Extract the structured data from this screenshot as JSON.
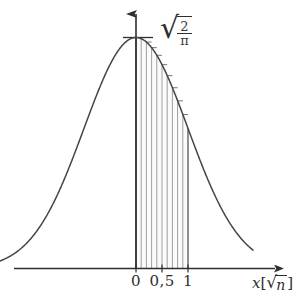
{
  "figure": {
    "name": "half-normal-density-with-histogram",
    "background": "#ffffff",
    "curve_color": "#454545",
    "axis_color": "#3a3a3a",
    "bar_color": "#8a8a8a"
  },
  "labels": {
    "peak_value_radical_sign": "√",
    "peak_value_numerator": "2",
    "peak_value_denominator": "π",
    "x_axis_label_variable": "x",
    "x_axis_label_bracket_open": "[",
    "x_axis_label_sqrt_sign": "√",
    "x_axis_label_sqrt_arg": "n",
    "x_axis_label_bracket_close": "]"
  },
  "x_ticks": [
    {
      "value": 0,
      "label": "0",
      "px": 136.0
    },
    {
      "value": 0.5,
      "label": "0,5",
      "px": 162.0
    },
    {
      "value": 1,
      "label": "1",
      "px": 188.0
    }
  ],
  "chart_data": {
    "type": "line",
    "title": "",
    "xlabel": "x[√n]",
    "ylabel": "",
    "grid": false,
    "legend": null,
    "xlim": [
      -2.65,
      2.25
    ],
    "ylim": [
      0,
      0.92
    ],
    "peak_value": 0.7979,
    "peak_label": "√(2/π)",
    "series": [
      {
        "name": "half-normal density (folded about x=0 shown symmetric)",
        "formula": "sqrt(2/pi) * exp(-x^2/2)",
        "x": [
          -2.65,
          -2.5,
          -2.35,
          -2.2,
          -2.05,
          -1.9,
          -1.75,
          -1.6,
          -1.45,
          -1.3,
          -1.15,
          -1.0,
          -0.85,
          -0.7,
          -0.55,
          -0.4,
          -0.25,
          -0.1,
          0,
          0.1,
          0.25,
          0.4,
          0.55,
          0.7,
          0.85,
          1.0,
          1.15,
          1.3,
          1.45,
          1.6,
          1.75,
          1.9,
          2.05,
          2.2
        ],
        "y": [
          0.0242,
          0.0359,
          0.0519,
          0.0734,
          0.1013,
          0.1366,
          0.1799,
          0.2313,
          0.2902,
          0.3549,
          0.4228,
          0.4839,
          0.5526,
          0.6144,
          0.6663,
          0.7365,
          0.7734,
          0.7939,
          0.7979,
          0.7939,
          0.7734,
          0.7365,
          0.6663,
          0.6144,
          0.5526,
          0.4839,
          0.4228,
          0.3549,
          0.2902,
          0.2313,
          0.1799,
          0.1366,
          0.1013,
          0.0734
        ]
      }
    ],
    "histogram": {
      "name": "step-bars-under-curve",
      "x_start": 0,
      "x_end": 1,
      "n_bars": 10,
      "bin_width": 0.1,
      "bar_left_edges": [
        0.0,
        0.1,
        0.2,
        0.3,
        0.4,
        0.5,
        0.6,
        0.7,
        0.8,
        0.9
      ],
      "bar_heights": [
        0.7979,
        0.7939,
        0.7821,
        0.7628,
        0.7365,
        0.7041,
        0.6663,
        0.6244,
        0.5792,
        0.5318
      ]
    }
  }
}
